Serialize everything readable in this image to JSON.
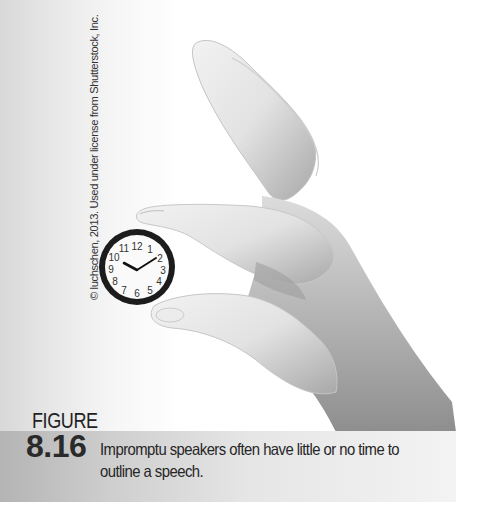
{
  "photo": {
    "subject": "hand holding a small wall clock between thumb and index finger",
    "credit": "© luchschen, 2013. Used under license from Shutterstock, Inc.",
    "clock": {
      "numerals": [
        "12",
        "1",
        "2",
        "3",
        "4",
        "5",
        "6",
        "7",
        "8",
        "9",
        "10",
        "11"
      ],
      "hour_hand_points_to": "10",
      "minute_hand_points_to": "2",
      "time_shown": "10:10"
    }
  },
  "figure": {
    "label": "FIGURE",
    "number": "8.16",
    "caption_line1": "Impromptu speakers often have little or no time to",
    "caption_line2": "outline a speech."
  },
  "colors": {
    "background": "#ffffff",
    "caption_band_left": "#b4b4b4",
    "caption_band_right": "#f3f3f3",
    "text": "#262626",
    "clock_rim": "#1a1a1a"
  }
}
